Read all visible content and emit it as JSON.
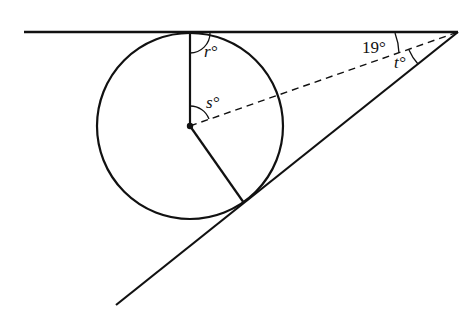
{
  "diagram": {
    "labels": {
      "r": "r°",
      "s": "s°",
      "t": "t°",
      "angle_top": "19°"
    },
    "stroke_color": "#111111",
    "geometry": {
      "top_line": {
        "x1": 24,
        "y1": 32,
        "x2": 458,
        "y2": 32
      },
      "lower_line": {
        "x1": 458,
        "y1": 32,
        "x2": 116,
        "y2": 305
      },
      "circle": {
        "cx": 190,
        "cy": 126,
        "r": 93
      },
      "radius_up": {
        "x2": 190,
        "y2": 33
      },
      "radius_tangent": {
        "x2": 244,
        "y2": 203
      },
      "dashed_bisector": {
        "x1": 190,
        "y1": 126,
        "x2": 458,
        "y2": 32
      }
    }
  }
}
